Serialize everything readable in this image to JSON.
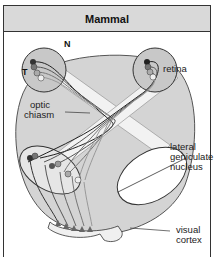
{
  "header": {
    "title": "Mammal"
  },
  "labels": {
    "nasal": "N",
    "temporal": "T",
    "retina": "retina",
    "optic_chiasm_line1": "optic",
    "optic_chiasm_line2": "chiasm",
    "lgn_line1": "lateral",
    "lgn_line2": "geniculate",
    "lgn_line3": "nucleus",
    "visual_cortex_line1": "visual",
    "visual_cortex_line2": "cortex"
  },
  "colors": {
    "brain_fill": "#d4d4d4",
    "eye_fill": "#c8c8c8",
    "tract_fill": "#f2f2f2",
    "outline": "#333333",
    "header_fill": "#d9d9d9"
  }
}
